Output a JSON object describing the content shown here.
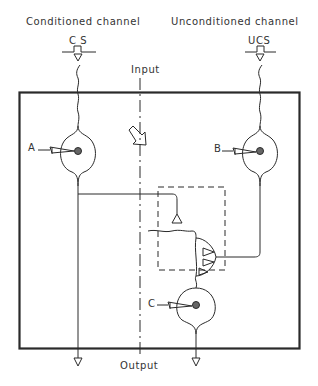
{
  "diagram": {
    "channels": {
      "conditioned": {
        "label": "Conditioned channel",
        "stimulus": "C S"
      },
      "unconditioned": {
        "label": "Unconditioned channel",
        "stimulus": "UCS"
      }
    },
    "axis_labels": {
      "input": "Input",
      "output": "Output"
    },
    "neurons": [
      {
        "id": "A",
        "label": "A",
        "channel": "conditioned"
      },
      {
        "id": "B",
        "label": "B",
        "channel": "unconditioned"
      },
      {
        "id": "C",
        "label": "C",
        "channel": "output"
      }
    ],
    "elements": {
      "outer_box": "circuit boundary",
      "dashed_box": "synaptic convergence region",
      "arrow": "diagonal open arrow pointing down-right"
    },
    "colors": {
      "stroke": "#2a2a2a",
      "background": "#ffffff"
    }
  }
}
